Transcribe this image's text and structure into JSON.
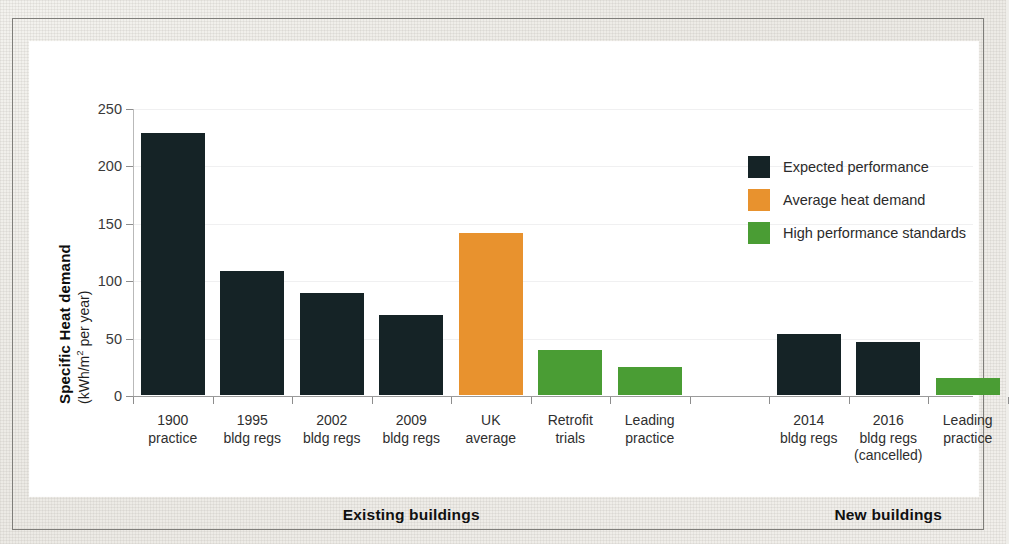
{
  "figure": {
    "background_color": "#efeeea",
    "canvas_color": "#ffffff",
    "frame_border_color": "#7e7d79"
  },
  "chart_data": {
    "type": "bar",
    "title": "",
    "xlabel": "",
    "ylabel": "Specific Heat demand (kWh/m² per year)",
    "ylabel_main": "Specific Heat demand",
    "ylabel_units": "(kWh/m2 per year)",
    "ylim": [
      0,
      250
    ],
    "yticks": [
      0,
      50,
      100,
      150,
      200,
      250
    ],
    "ytick_labels": [
      "0",
      "50",
      "100",
      "150",
      "200",
      "250"
    ],
    "grid": true,
    "grid_axis": "y",
    "legend_position": "upper right",
    "categories": [
      "1900 practice",
      "1995 bldg regs",
      "2002 bldg regs",
      "2009 bldg regs",
      "UK average",
      "Retrofit trials",
      "Leading practice",
      "2014 bldg regs",
      "2016 bldg regs (cancelled)",
      "Leading practice"
    ],
    "values": [
      228,
      108,
      89,
      70,
      141,
      39,
      24,
      53,
      46,
      15
    ],
    "bar_series": [
      "Expected performance",
      "Expected performance",
      "Expected performance",
      "Expected performance",
      "Average heat demand",
      "High performance standards",
      "High performance standards",
      "Expected performance",
      "Expected performance",
      "High performance standards"
    ],
    "bars": [
      {
        "label_lines": [
          "1900",
          "practice"
        ],
        "value": 228,
        "series": "Expected performance",
        "color": "#152326"
      },
      {
        "label_lines": [
          "1995",
          "bldg regs"
        ],
        "value": 108,
        "series": "Expected performance",
        "color": "#152326"
      },
      {
        "label_lines": [
          "2002",
          "bldg regs"
        ],
        "value": 89,
        "series": "Expected performance",
        "color": "#152326"
      },
      {
        "label_lines": [
          "2009",
          "bldg regs"
        ],
        "value": 70,
        "series": "Expected performance",
        "color": "#152326"
      },
      {
        "label_lines": [
          "UK",
          "average"
        ],
        "value": 141,
        "series": "Average heat demand",
        "color": "#E8922E"
      },
      {
        "label_lines": [
          "Retrofit",
          "trials"
        ],
        "value": 39,
        "series": "High performance standards",
        "color": "#4A9D34"
      },
      {
        "label_lines": [
          "Leading",
          "practice"
        ],
        "value": 24,
        "series": "High performance standards",
        "color": "#4A9D34"
      },
      {
        "label_lines": [
          "2014",
          "bldg regs"
        ],
        "value": 53,
        "series": "Expected performance",
        "color": "#152326"
      },
      {
        "label_lines": [
          "2016",
          "bldg regs",
          "(cancelled)"
        ],
        "value": 46,
        "series": "Expected performance",
        "color": "#152326"
      },
      {
        "label_lines": [
          "Leading",
          "practice"
        ],
        "value": 15,
        "series": "High performance standards",
        "color": "#4A9D34"
      }
    ],
    "groups": [
      {
        "label": "Existing buildings",
        "bar_indices": [
          0,
          1,
          2,
          3,
          4,
          5,
          6
        ]
      },
      {
        "label": "New buildings",
        "bar_indices": [
          7,
          8,
          9
        ]
      }
    ],
    "legend": [
      {
        "label": "Expected performance",
        "color": "#152326"
      },
      {
        "label": "Average heat demand",
        "color": "#E8922E"
      },
      {
        "label": "High performance standards",
        "color": "#4A9D34"
      }
    ],
    "colors": {
      "expected_performance": "#152326",
      "average_heat_demand": "#E8922E",
      "high_performance_standards": "#4A9D34",
      "gridline": "#f0f0f1",
      "axis": "#9a9a9a"
    }
  }
}
